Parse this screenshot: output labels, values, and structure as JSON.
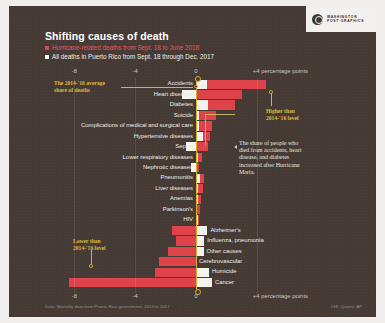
{
  "headline": "Shifting causes of death",
  "legend": [
    {
      "key": "hurricane",
      "label": "Hurricane-related deaths from Sept. 18 to June 2018",
      "color": "#e8565c"
    },
    {
      "key": "all_deaths",
      "label": "All deaths in Puerto Rico from Sept. 18 through Dec. 2017",
      "color": "#f2efeb"
    }
  ],
  "logo": {
    "line1": "WASHINGTON",
    "line2": "POST GRAPHICS"
  },
  "annotations": {
    "avg_share": "The 2014-'16 average\nshare of deaths",
    "higher": "Higher than\n2014-'16 level",
    "lower": "Lower than\n2014-'16 level",
    "note": "The share of people who\ndied from accidents, heart\ndisease, and diabetes\nincreased after Hurricane\nMaria."
  },
  "footer": {
    "source": "Data: Mortality data from Puerto Rico government, 2014 to 2017",
    "credit": "CHI, Quartz, AP"
  },
  "chart_data": {
    "type": "bar",
    "title": "Shifting causes of death",
    "xlabel": "percentage points",
    "ylabel": "",
    "xlim": [
      -8.8,
      4.8
    ],
    "grid": false,
    "legend_position": "top",
    "orientation": "horizontal",
    "axis_ticks": [
      {
        "value": -8,
        "label": "-8"
      },
      {
        "value": -4,
        "label": "-4"
      },
      {
        "value": 0,
        "label": "0"
      },
      {
        "value": 4,
        "label": "+4 percentage points"
      }
    ],
    "series": [
      {
        "name": "Hurricane-related deaths from Sept. 18 to June 2018",
        "color": "#e0424a"
      },
      {
        "name": "All deaths in Puerto Rico from Sept. 18 through Dec. 2017",
        "color": "#f4f2ee"
      }
    ],
    "categories": [
      "Accidents",
      "Heart diseases",
      "Diabetes",
      "Suicide",
      "Complications of medical and surgical care",
      "Hypertensive diseases",
      "Sepsis",
      "Lower respiratory diseases",
      "Nephrotic diseases",
      "Pneumonitis",
      "Liver diseases",
      "Anemias",
      "Parkinson's",
      "HIV",
      "Alzheimer's",
      "Influenza, pneumonia",
      "Other causes",
      "Cerebrovascular",
      "Homicide",
      "Cancer"
    ],
    "points": [
      {
        "category": "Accidents",
        "hurricane": 4.6,
        "all_deaths": 0.7,
        "label_side": "left"
      },
      {
        "category": "Heart diseases",
        "hurricane": 3.05,
        "all_deaths": -0.95,
        "label_side": "left"
      },
      {
        "category": "Diabetes",
        "hurricane": 2.55,
        "all_deaths": 0.8,
        "label_side": "left"
      },
      {
        "category": "Suicide",
        "hurricane": 1.3,
        "all_deaths": 0.22,
        "label_side": "left"
      },
      {
        "category": "Complications of medical and surgical care",
        "hurricane": 1.05,
        "all_deaths": 0.2,
        "label_side": "left"
      },
      {
        "category": "Hypertensive diseases",
        "hurricane": 0.95,
        "all_deaths": 0.45,
        "label_side": "left"
      },
      {
        "category": "Sepsis",
        "hurricane": 0.8,
        "all_deaths": -0.65,
        "label_side": "left"
      },
      {
        "category": "Lower respiratory diseases",
        "hurricane": 0.4,
        "all_deaths": 0.12,
        "label_side": "left"
      },
      {
        "category": "Nephrotic diseases",
        "hurricane": 0.2,
        "all_deaths": -0.3,
        "label_side": "left"
      },
      {
        "category": "Pneumonitis",
        "hurricane": 0.55,
        "all_deaths": 0.28,
        "label_side": "left"
      },
      {
        "category": "Liver diseases",
        "hurricane": 0.45,
        "all_deaths": 0.15,
        "label_side": "left"
      },
      {
        "category": "Anemias",
        "hurricane": 0.32,
        "all_deaths": 0.1,
        "label_side": "left"
      },
      {
        "category": "Parkinson's",
        "hurricane": 0.28,
        "all_deaths": 0.08,
        "label_side": "left"
      },
      {
        "category": "HIV",
        "hurricane": 0.22,
        "all_deaths": 0.1,
        "label_side": "left"
      },
      {
        "category": "Alzheimer's",
        "hurricane": -1.55,
        "all_deaths": 0.75,
        "label_side": "right"
      },
      {
        "category": "Influenza, pneumonia",
        "hurricane": -1.3,
        "all_deaths": 0.55,
        "label_side": "right"
      },
      {
        "category": "Other causes",
        "hurricane": -1.85,
        "all_deaths": 0.5,
        "label_side": "right"
      },
      {
        "category": "Cerebrovascular",
        "hurricane": -2.45,
        "all_deaths": 0.0,
        "label_side": "right"
      },
      {
        "category": "Homicide",
        "hurricane": -2.7,
        "all_deaths": 0.85,
        "label_side": "right"
      },
      {
        "category": "Cancer",
        "hurricane": -8.35,
        "all_deaths": 1.05,
        "label_side": "right"
      }
    ]
  }
}
